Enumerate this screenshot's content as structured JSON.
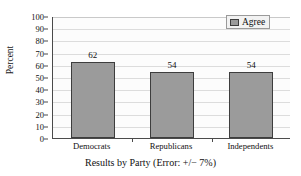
{
  "chart_data": {
    "type": "bar",
    "title": "",
    "categories": [
      "Democrats",
      "Republicans",
      "Independents"
    ],
    "values": [
      62,
      54,
      54
    ],
    "series": [
      {
        "name": "Agree",
        "values": [
          62,
          54,
          54
        ]
      }
    ],
    "xlabel": "Results by Party (Error: +/− 7%)",
    "ylabel": "Percent",
    "ylim": [
      0,
      100
    ],
    "ytick_step": 10,
    "yticks": [
      100,
      90,
      80,
      70,
      60,
      50,
      40,
      30,
      20,
      10,
      0
    ],
    "grid": true,
    "grid_axis": "y",
    "legend": [
      "Agree"
    ],
    "legend_position": "top-right",
    "bar_color": "#9b9b9b",
    "bar_edge_color": "#3d3d3d",
    "gridline_color": "#dcdcdc",
    "plot_background": "#fcfcfc",
    "axis_color": "#4a4a4a",
    "value_labels": [
      "62",
      "54",
      "54"
    ]
  },
  "legend": {
    "entry_label": "Agree"
  },
  "axes": {
    "y_title": "Percent",
    "x_title": "Results by Party (Error: +/− 7%)"
  }
}
